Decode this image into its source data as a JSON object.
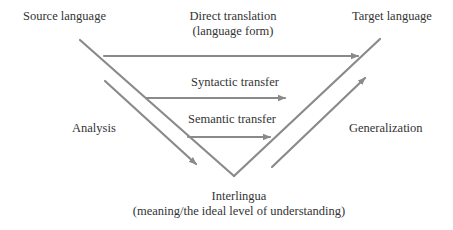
{
  "diagram": {
    "colors": {
      "line": "#8a8a8a",
      "text": "#333333",
      "background": "#ffffff"
    },
    "labels": {
      "source": "Source language",
      "target": "Target language",
      "direct_line1": "Direct translation",
      "direct_line2": "(language form)",
      "syntactic": "Syntactic transfer",
      "semantic": "Semantic transfer",
      "analysis": "Analysis",
      "generalization": "Generalization",
      "interlingua_line1": "Interlingua",
      "interlingua_line2": "(meaning/the ideal level of understanding)"
    },
    "edges": [
      {
        "from": "Source language",
        "to": "Interlingua",
        "type": "triangle-side"
      },
      {
        "from": "Interlingua",
        "to": "Target language",
        "type": "triangle-side"
      },
      {
        "from": "Source language",
        "to": "Target language",
        "type": "arrow",
        "label": "Direct translation"
      },
      {
        "from": "Source language",
        "to": "Target language",
        "type": "arrow",
        "label": "Syntactic transfer"
      },
      {
        "from": "Source language",
        "to": "Target language",
        "type": "arrow",
        "label": "Semantic transfer"
      },
      {
        "from": "Source language",
        "to": "Interlingua",
        "type": "arrow",
        "label": "Analysis"
      },
      {
        "from": "Interlingua",
        "to": "Target language",
        "type": "arrow",
        "label": "Generalization"
      }
    ]
  }
}
